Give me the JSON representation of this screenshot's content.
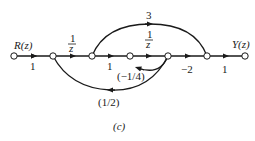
{
  "figure": {
    "caption": "(c)",
    "type": "signal-flow-graph",
    "input_label": "R(z)",
    "output_label": "Y(z)"
  },
  "nodes": [
    {
      "id": "n1",
      "x": 14
    },
    {
      "id": "n2",
      "x": 53
    },
    {
      "id": "n3",
      "x": 92
    },
    {
      "id": "n4",
      "x": 130
    },
    {
      "id": "n5",
      "x": 168
    },
    {
      "id": "n6",
      "x": 207
    },
    {
      "id": "n7",
      "x": 245
    }
  ],
  "branches": [
    {
      "from": "n1",
      "to": "n2",
      "gain": "1"
    },
    {
      "from": "n2",
      "to": "n3",
      "gain_num": "1",
      "gain_den": "z"
    },
    {
      "from": "n3",
      "to": "n4",
      "gain": "1"
    },
    {
      "from": "n4",
      "to": "n5",
      "gain_num": "1",
      "gain_den": "z"
    },
    {
      "from": "n5",
      "to": "n6",
      "gain": "−2"
    },
    {
      "from": "n6",
      "to": "n7",
      "gain": "1"
    },
    {
      "from": "n3",
      "to": "n6",
      "gain": "3"
    },
    {
      "from": "n5",
      "to": "n4",
      "gain": "(−1/4)"
    },
    {
      "from": "n5",
      "to": "n2",
      "gain": "(1/2)"
    }
  ],
  "colors": {
    "stroke": "#1a1a1a",
    "node_fill": "#ffffff"
  }
}
